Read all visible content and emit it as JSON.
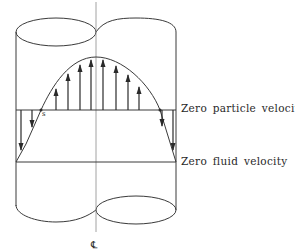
{
  "diagram": {
    "labels": {
      "zero_particle_velocity": "Zero particle velocity",
      "zero_fluid_velocity": "Zero fluid velocity",
      "point_s": "s",
      "centerline_symbol": "℄"
    },
    "colors": {
      "stroke": "#3a3a3a",
      "centerline": "#8a8a8a",
      "background": "#ffffff"
    },
    "geometry": {
      "centerline_x": 96,
      "left_wall_x": 16,
      "right_wall_x": 176,
      "zero_particle_y": 110,
      "zero_fluid_y": 162,
      "parabola_peak_y": 57,
      "point_s": [
        41,
        110
      ],
      "top_cusp_y": 32,
      "bottom_cusp_y": 210
    },
    "up_arrows_x": [
      56,
      68,
      80,
      90,
      102,
      116,
      128,
      139
    ],
    "down_arrows_x": [
      22,
      32,
      162,
      173
    ]
  }
}
